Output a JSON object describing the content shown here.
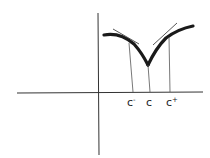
{
  "diagram": {
    "colors": {
      "ink": "#1a1a1a",
      "thin": "#444444",
      "background": "#ffffff"
    },
    "labels": {
      "c_minus": {
        "base": "c",
        "sup": "-"
      },
      "c": {
        "base": "c"
      },
      "c_plus": {
        "base": "c",
        "sup": "+"
      }
    }
  }
}
